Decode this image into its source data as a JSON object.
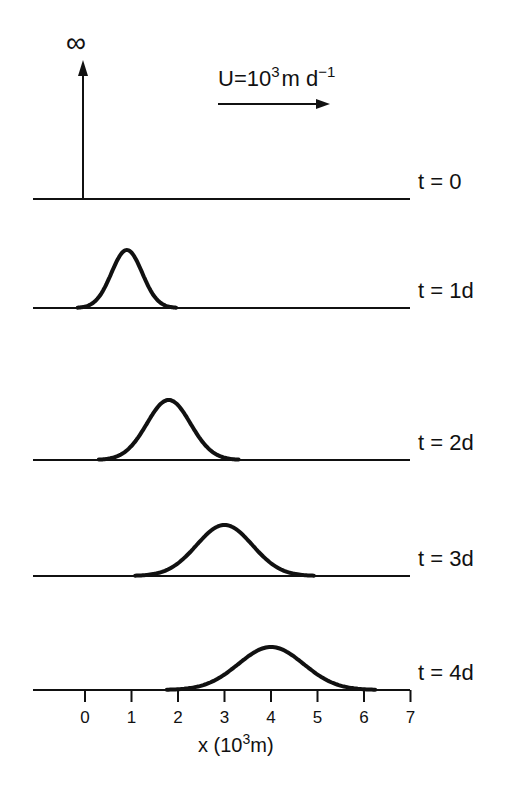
{
  "chart_data": {
    "type": "line",
    "title": "",
    "annotation": {
      "velocity_label": "U=10",
      "velocity_exp": "3",
      "velocity_unit": "m d",
      "velocity_unit_exp": "−1",
      "infinity_symbol": "∞"
    },
    "xlabel_prefix": "x (10",
    "xlabel_exp": "3",
    "xlabel_suffix": "m)",
    "xticks": [
      "0",
      "1",
      "2",
      "3",
      "4",
      "5",
      "6",
      "7"
    ],
    "xlim": [
      -1.1,
      7
    ],
    "series": [
      {
        "name": "t=0",
        "label": "t=0",
        "type": "delta",
        "center": 0,
        "baseline_y": 199
      },
      {
        "name": "t=1d",
        "label": "t=1d",
        "center": 0.9,
        "sigma": 0.33,
        "peak_px": 58,
        "baseline_y": 308
      },
      {
        "name": "t=2d",
        "label": "t=2d",
        "center": 1.8,
        "sigma": 0.47,
        "peak_px": 60,
        "baseline_y": 460
      },
      {
        "name": "t=3d",
        "label": "t=3d",
        "center": 3.0,
        "sigma": 0.6,
        "peak_px": 51,
        "baseline_y": 576
      },
      {
        "name": "t=4d",
        "label": "t=4d",
        "center": 4.0,
        "sigma": 0.7,
        "peak_px": 43,
        "baseline_y": 690
      }
    ],
    "layout": {
      "x0_px": 85,
      "px_per_unit": 46.5,
      "line_left": 33,
      "line_right": 410
    }
  }
}
